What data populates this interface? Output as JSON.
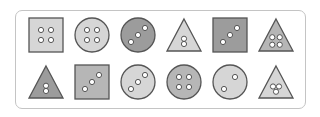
{
  "puzzle": {
    "colors": {
      "light": "#d6d6d6",
      "medium": "#b6b6b6",
      "dark": "#9c9c9c",
      "stroke": "#555555",
      "dot": "#ffffff"
    },
    "rows": [
      [
        {
          "shape": "square",
          "shade": "light",
          "dots": 4,
          "pattern": "grid"
        },
        {
          "shape": "circle",
          "shade": "light",
          "dots": 4,
          "pattern": "grid"
        },
        {
          "shape": "circle",
          "shade": "dark",
          "dots": 3,
          "pattern": "diagonal"
        },
        {
          "shape": "triangle",
          "shade": "light",
          "dots": 2,
          "pattern": "vertical"
        },
        {
          "shape": "square",
          "shade": "dark",
          "dots": 3,
          "pattern": "diagonal"
        },
        {
          "shape": "triangle",
          "shade": "medium",
          "dots": 4,
          "pattern": "grid"
        }
      ],
      [
        {
          "shape": "triangle",
          "shade": "dark",
          "dots": 2,
          "pattern": "vertical"
        },
        {
          "shape": "square",
          "shade": "medium",
          "dots": 3,
          "pattern": "diagonal"
        },
        {
          "shape": "circle",
          "shade": "light",
          "dots": 3,
          "pattern": "diagonal"
        },
        {
          "shape": "circle",
          "shade": "medium",
          "dots": 4,
          "pattern": "grid"
        },
        {
          "shape": "circle",
          "shade": "light",
          "dots": 2,
          "pattern": "diagonal-wide"
        },
        {
          "shape": "triangle",
          "shade": "light",
          "dots": 3,
          "pattern": "cluster"
        }
      ]
    ]
  }
}
